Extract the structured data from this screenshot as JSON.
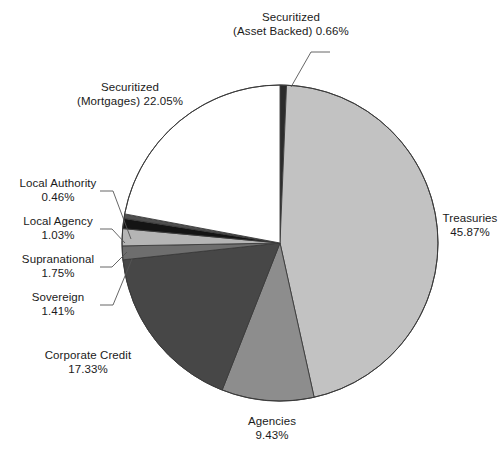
{
  "chart_data": {
    "type": "pie",
    "title": "",
    "subtitle": "",
    "xlabel": "",
    "ylabel": "",
    "legend_position": "none",
    "grid": false,
    "units": "percent",
    "start_angle_deg": 0,
    "direction": "clockwise",
    "categories": [
      "Securitized (Asset Backed)",
      "Treasuries",
      "Agencies",
      "Corporate Credit",
      "Sovereign",
      "Supranational",
      "Local Agency",
      "Local Authority",
      "Securitized (Mortgages)"
    ],
    "values": [
      0.66,
      45.87,
      9.43,
      17.33,
      1.41,
      1.75,
      1.03,
      0.46,
      22.05
    ],
    "slices": [
      {
        "id": "asset-backed",
        "name": "Securitized (Asset Backed)",
        "value": 0.66,
        "value_text": "0.66%",
        "color": "#2b2b2b",
        "label_line1": "Securitized",
        "label_line2": "(Asset Backed) 0.66%"
      },
      {
        "id": "treasuries",
        "name": "Treasuries",
        "value": 45.87,
        "value_text": "45.87%",
        "color": "#c2c2c2",
        "label_line1": "Treasuries",
        "label_line2": "45.87%"
      },
      {
        "id": "agencies",
        "name": "Agencies",
        "value": 9.43,
        "value_text": "9.43%",
        "color": "#8d8d8d",
        "label_line1": "Agencies",
        "label_line2": "9.43%"
      },
      {
        "id": "corporate-credit",
        "name": "Corporate Credit",
        "value": 17.33,
        "value_text": "17.33%",
        "color": "#474747",
        "label_line1": "Corporate Credit",
        "label_line2": "17.33%"
      },
      {
        "id": "sovereign",
        "name": "Sovereign",
        "value": 1.41,
        "value_text": "1.41%",
        "color": "#6e6e6e",
        "label_line1": "Sovereign",
        "label_line2": "1.41%"
      },
      {
        "id": "supranational",
        "name": "Supranational",
        "value": 1.75,
        "value_text": "1.75%",
        "color": "#b5b5b5",
        "label_line1": "Supranational",
        "label_line2": "1.75%"
      },
      {
        "id": "local-agency",
        "name": "Local Agency",
        "value": 1.03,
        "value_text": "1.03%",
        "color": "#141414",
        "label_line1": "Local Agency",
        "label_line2": "1.03%"
      },
      {
        "id": "local-authority",
        "name": "Local Authority",
        "value": 0.46,
        "value_text": "0.46%",
        "color": "#4f4f4f",
        "label_line1": "Local Authority",
        "label_line2": "0.46%"
      },
      {
        "id": "mortgages",
        "name": "Securitized (Mortgages)",
        "value": 22.05,
        "value_text": "22.05%",
        "color": "#ffffff",
        "label_line1": "Securitized",
        "label_line2": "(Mortgages) 22.05%"
      }
    ],
    "geometry": {
      "center_x": 280,
      "center_y": 243,
      "radius": 158,
      "outline_color": "#3a3a3a"
    }
  }
}
